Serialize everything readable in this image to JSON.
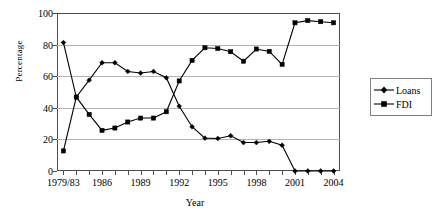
{
  "chart_data": {
    "type": "line",
    "title": "",
    "xlabel": "Year",
    "ylabel": "Percentage",
    "ylim": [
      0,
      100
    ],
    "yticks": [
      0,
      20,
      40,
      60,
      80,
      100
    ],
    "grid": true,
    "legend_position": "right",
    "x": [
      "1979/83",
      "1984",
      "1985",
      "1986",
      "1987",
      "1988",
      "1989",
      "1990",
      "1991",
      "1992",
      "1993",
      "1994",
      "1995",
      "1996",
      "1997",
      "1998",
      "1999",
      "2000",
      "2001",
      "2002",
      "2003",
      "2004"
    ],
    "xtick_labels": [
      "1979/83",
      "1986",
      "1989",
      "1992",
      "1995",
      "1998",
      "2001",
      "2004"
    ],
    "xtick_indices": [
      0,
      3,
      6,
      9,
      12,
      15,
      18,
      21
    ],
    "series": [
      {
        "name": "Loans",
        "marker": "diamond",
        "color": "#000000",
        "values": [
          81.3,
          46.8,
          57.5,
          68.5,
          68.5,
          63.0,
          62.0,
          63.0,
          59.0,
          41.0,
          28.0,
          20.8,
          20.6,
          22.3,
          18.0,
          18.0,
          18.8,
          16.3,
          0.0,
          0.0,
          0.0,
          0.0
        ]
      },
      {
        "name": "FDI",
        "marker": "square",
        "color": "#000000",
        "values": [
          12.7,
          46.8,
          35.8,
          25.7,
          27.2,
          31.0,
          33.5,
          33.5,
          37.5,
          57.0,
          70.0,
          78.0,
          77.5,
          75.5,
          69.5,
          77.2,
          75.7,
          67.5,
          93.8,
          95.2,
          94.5,
          93.8
        ]
      }
    ]
  },
  "legend": {
    "items": [
      {
        "label": "Loans",
        "marker": "diamond"
      },
      {
        "label": "FDI",
        "marker": "square"
      }
    ]
  }
}
